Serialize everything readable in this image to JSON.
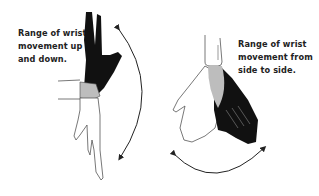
{
  "figure": {
    "left_panel": {
      "caption_lines": [
        "Range of wrist",
        "movement up",
        "and down."
      ],
      "description": "Hand shown pointing up (dark silhouette) and pointing down (outline), with curved double-headed arc arrow on right"
    },
    "right_panel": {
      "caption_lines": [
        "Range of wrist",
        "movement from",
        "side to side."
      ],
      "description": "Hand shown tilted left (outline) and right (dark silhouette) with shared gray wrist, curved double-headed arc arrow below"
    },
    "colors": {
      "dark_hand": "#111111",
      "outline": "#555555",
      "wrist_shade": "#bdbdbd",
      "background": "#ffffff"
    }
  }
}
